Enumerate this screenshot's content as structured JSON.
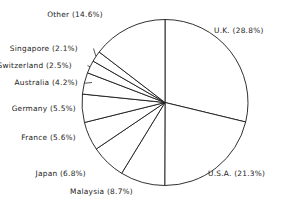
{
  "chart_data": {
    "type": "pie",
    "title": "",
    "subtitle": "",
    "xlabel": "",
    "ylabel": "",
    "legend_position": "none",
    "grid": false,
    "value_unit": "percent",
    "start_angle_deg": 0,
    "direction": "clockwise",
    "categories": [
      "U.K.",
      "U.S.A.",
      "Malaysia",
      "Japan",
      "France",
      "Germany",
      "Australia",
      "Switzerland",
      "Singapore",
      "Other"
    ],
    "values": [
      28.8,
      21.3,
      8.7,
      6.8,
      5.6,
      5.5,
      4.2,
      2.5,
      2.1,
      14.6
    ],
    "slices": [
      {
        "name": "U.K.",
        "value": 28.8,
        "label": "U.K. (28.8%)",
        "label_side": "right"
      },
      {
        "name": "U.S.A.",
        "value": 21.3,
        "label": "U.S.A. (21.3%)",
        "label_side": "right"
      },
      {
        "name": "Malaysia",
        "value": 8.7,
        "label": "Malaysia (8.7%)",
        "label_side": "left"
      },
      {
        "name": "Japan",
        "value": 6.8,
        "label": "Japan (6.8%)",
        "label_side": "left"
      },
      {
        "name": "France",
        "value": 5.6,
        "label": "France (5.6%)",
        "label_side": "left"
      },
      {
        "name": "Germany",
        "value": 5.5,
        "label": "Germany (5.5%)",
        "label_side": "left"
      },
      {
        "name": "Australia",
        "value": 4.2,
        "label": "Australia (4.2%)",
        "label_side": "left"
      },
      {
        "name": "Switzerland",
        "value": 2.5,
        "label": "Switzerland (2.5%)",
        "label_side": "left"
      },
      {
        "name": "Singapore",
        "value": 2.1,
        "label": "Singapore (2.1%)",
        "label_side": "left"
      },
      {
        "name": "Other",
        "value": 14.6,
        "label": "Other (14.6%)",
        "label_side": "left"
      }
    ],
    "colors": {
      "slice_fill": "#ffffff",
      "slice_outline": "#1a1a1a",
      "label_text": "#232323",
      "background": "#ffffff"
    }
  },
  "labels": {
    "uk": "U.K. (28.8%)",
    "usa": "U.S.A. (21.3%)",
    "malaysia": "Malaysia (8.7%)",
    "japan": "Japan (6.8%)",
    "france": "France (5.6%)",
    "germany": "Germany (5.5%)",
    "australia": "Australia (4.2%)",
    "switzerland": "Switzerland (2.5%)",
    "singapore": "Singapore (2.1%)",
    "other": "Other (14.6%)"
  }
}
